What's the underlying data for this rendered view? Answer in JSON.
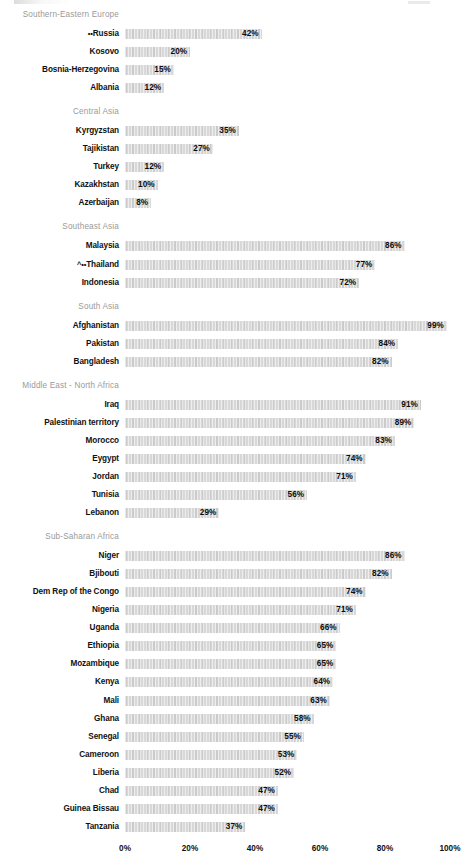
{
  "chart_data": {
    "type": "bar",
    "orientation": "horizontal",
    "title": "",
    "xlabel": "",
    "ylabel": "",
    "xlim": [
      0,
      100
    ],
    "grid": false,
    "legend": false,
    "value_suffix": "%",
    "axis_ticks": [
      "0%",
      "20%",
      "40%",
      "60%",
      "80%",
      "100%"
    ],
    "axis_tick_values": [
      0,
      20,
      40,
      60,
      80,
      100
    ],
    "groups": [
      {
        "name": "Southern-Eastern Europe",
        "rows": [
          {
            "label": "Russia",
            "marker": "••",
            "value": 42,
            "value_label": "42%"
          },
          {
            "label": "Kosovo",
            "marker": "",
            "value": 20,
            "value_label": "20%"
          },
          {
            "label": "Bosnia-Herzegovina",
            "marker": "",
            "value": 15,
            "value_label": "15%"
          },
          {
            "label": "Albania",
            "marker": "",
            "value": 12,
            "value_label": "12%"
          }
        ]
      },
      {
        "name": "Central Asia",
        "rows": [
          {
            "label": "Kyrgyzstan",
            "marker": "",
            "value": 35,
            "value_label": "35%"
          },
          {
            "label": "Tajikistan",
            "marker": "",
            "value": 27,
            "value_label": "27%"
          },
          {
            "label": "Turkey",
            "marker": "",
            "value": 12,
            "value_label": "12%"
          },
          {
            "label": "Kazakhstan",
            "marker": "",
            "value": 10,
            "value_label": "10%"
          },
          {
            "label": "Azerbaijan",
            "marker": "",
            "value": 8,
            "value_label": "8%"
          }
        ]
      },
      {
        "name": "Southeast Asia",
        "rows": [
          {
            "label": "Malaysia",
            "marker": "",
            "value": 86,
            "value_label": "86%"
          },
          {
            "label": "Thailand",
            "marker": "^••",
            "value": 77,
            "value_label": "77%"
          },
          {
            "label": "Indonesia",
            "marker": "",
            "value": 72,
            "value_label": "72%"
          }
        ]
      },
      {
        "name": "South Asia",
        "rows": [
          {
            "label": "Afghanistan",
            "marker": "",
            "value": 99,
            "value_label": "99%"
          },
          {
            "label": "Pakistan",
            "marker": "",
            "value": 84,
            "value_label": "84%"
          },
          {
            "label": "Bangladesh",
            "marker": "",
            "value": 82,
            "value_label": "82%"
          }
        ]
      },
      {
        "name": "Middle East - North Africa",
        "rows": [
          {
            "label": "Iraq",
            "marker": "",
            "value": 91,
            "value_label": "91%"
          },
          {
            "label": "Palestinian territory",
            "marker": "",
            "value": 89,
            "value_label": "89%"
          },
          {
            "label": "Morocco",
            "marker": "",
            "value": 83,
            "value_label": "83%"
          },
          {
            "label": "Eygypt",
            "marker": "",
            "value": 74,
            "value_label": "74%"
          },
          {
            "label": "Jordan",
            "marker": "",
            "value": 71,
            "value_label": "71%"
          },
          {
            "label": "Tunisia",
            "marker": "",
            "value": 56,
            "value_label": "56%"
          },
          {
            "label": "Lebanon",
            "marker": "",
            "value": 29,
            "value_label": "29%"
          }
        ]
      },
      {
        "name": "Sub-Saharan Africa",
        "rows": [
          {
            "label": "Niger",
            "marker": "",
            "value": 86,
            "value_label": "86%"
          },
          {
            "label": "Bjibouti",
            "marker": "",
            "value": 82,
            "value_label": "82%"
          },
          {
            "label": "Dem Rep of the Congo",
            "marker": "",
            "value": 74,
            "value_label": "74%"
          },
          {
            "label": "Nigeria",
            "marker": "",
            "value": 71,
            "value_label": "71%"
          },
          {
            "label": "Uganda",
            "marker": "",
            "value": 66,
            "value_label": "66%"
          },
          {
            "label": "Ethiopia",
            "marker": "",
            "value": 65,
            "value_label": "65%"
          },
          {
            "label": "Mozambique",
            "marker": "",
            "value": 65,
            "value_label": "65%"
          },
          {
            "label": "Kenya",
            "marker": "",
            "value": 64,
            "value_label": "64%"
          },
          {
            "label": "Mali",
            "marker": "",
            "value": 63,
            "value_label": "63%"
          },
          {
            "label": "Ghana",
            "marker": "",
            "value": 58,
            "value_label": "58%"
          },
          {
            "label": "Senegal",
            "marker": "",
            "value": 55,
            "value_label": "55%"
          },
          {
            "label": "Cameroon",
            "marker": "",
            "value": 53,
            "value_label": "53%"
          },
          {
            "label": "Liberia",
            "marker": "",
            "value": 52,
            "value_label": "52%"
          },
          {
            "label": "Chad",
            "marker": "",
            "value": 47,
            "value_label": "47%"
          },
          {
            "label": "Guinea Bissau",
            "marker": "",
            "value": 47,
            "value_label": "47%"
          },
          {
            "label": "Tanzania",
            "marker": "",
            "value": 37,
            "value_label": "37%"
          }
        ]
      }
    ],
    "colors": {
      "bar_fill": "#d8d8d8",
      "label_text": "#111111",
      "group_header_text": "#9a9a9a",
      "background": "#ffffff"
    }
  }
}
